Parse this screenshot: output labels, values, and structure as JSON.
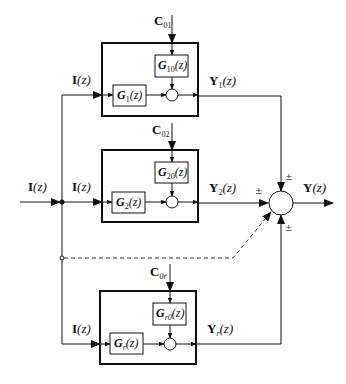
{
  "diagram": {
    "type": "block-diagram",
    "input": {
      "symbol": "I",
      "arg": "(z)"
    },
    "output": {
      "symbol": "Y",
      "arg": "(z)"
    },
    "branches": [
      {
        "id": "1",
        "input_label": {
          "symbol": "I",
          "arg": "(z)"
        },
        "disturbance": {
          "symbol": "C",
          "sub": "01"
        },
        "forward_block": {
          "symbol": "G",
          "sub": "1",
          "arg": "(z)"
        },
        "disturbance_block": {
          "symbol": "G",
          "sub": "10",
          "arg": "(z)"
        },
        "output_label": {
          "symbol": "Y",
          "sub": "1",
          "arg": "(z)"
        }
      },
      {
        "id": "2",
        "input_label": {
          "symbol": "I",
          "arg": "(z)"
        },
        "disturbance": {
          "symbol": "C",
          "sub": "02"
        },
        "forward_block": {
          "symbol": "G",
          "sub": "2",
          "arg": "(z)"
        },
        "disturbance_block": {
          "symbol": "G",
          "sub": "20",
          "arg": "(z)"
        },
        "output_label": {
          "symbol": "Y",
          "sub": "2",
          "arg": "(z)"
        }
      },
      {
        "id": "r",
        "input_label": {
          "symbol": "I",
          "arg": "(z)"
        },
        "disturbance": {
          "symbol": "C",
          "sub": "0r"
        },
        "forward_block": {
          "symbol": "G",
          "sub": "r",
          "arg": "(z)"
        },
        "disturbance_block": {
          "symbol": "G",
          "sub": "r0",
          "arg": "(z)"
        },
        "output_label": {
          "symbol": "Y",
          "sub": "r",
          "arg": "(z)"
        }
      }
    ],
    "summing_signs": {
      "top": "±",
      "left": "±",
      "bottom": "±"
    },
    "colors": {
      "line": "#111111",
      "dashed": "#333333",
      "background": "#ffffff"
    }
  }
}
